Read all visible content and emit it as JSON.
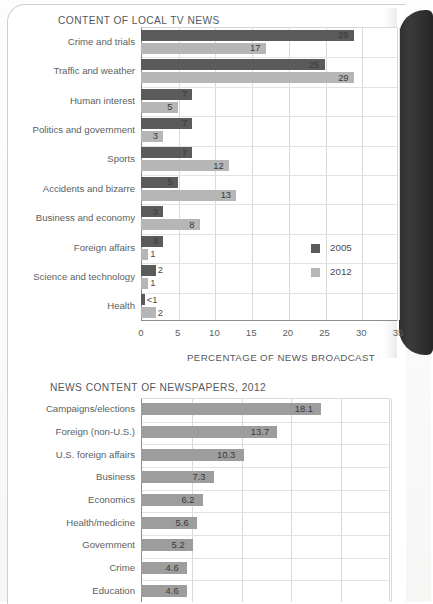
{
  "page": {
    "background_color": "#ffffff",
    "spine_color": "#2f2f2f"
  },
  "chart_data": [
    {
      "type": "bar",
      "orientation": "horizontal",
      "title": "CONTENT OF LOCAL TV NEWS",
      "xlabel": "PERCENTAGE OF NEWS BROADCAST",
      "ylabel": "",
      "xlim": [
        0,
        35
      ],
      "xticks": [
        0,
        5,
        10,
        15,
        20,
        25,
        30,
        35
      ],
      "grid": true,
      "legend_position": "inside-right",
      "categories": [
        "Crime and trials",
        "Traffic and weather",
        "Human interest",
        "Politics and government",
        "Sports",
        "Accidents and bizarre",
        "Business and economy",
        "Foreign affairs",
        "Science and technology",
        "Health"
      ],
      "series": [
        {
          "name": "2005",
          "color": "#5b5b5b",
          "values": [
            29,
            25,
            7,
            7,
            7,
            5,
            3,
            3,
            2,
            0.5
          ],
          "labels": [
            "29",
            "25",
            "7",
            "7",
            "7",
            "5",
            "3",
            "3",
            "2",
            "<1"
          ]
        },
        {
          "name": "2012",
          "color": "#b6b6b6",
          "values": [
            17,
            29,
            5,
            3,
            12,
            13,
            8,
            1,
            1,
            2
          ],
          "labels": [
            "17",
            "29",
            "5",
            "3",
            "12",
            "13",
            "8",
            "1",
            "1",
            "2"
          ]
        }
      ]
    },
    {
      "type": "bar",
      "orientation": "horizontal",
      "title": "NEWS CONTENT OF NEWSPAPERS, 2012",
      "xlabel": "",
      "ylabel": "",
      "xlim": [
        0,
        25
      ],
      "xticks": [
        0,
        5,
        10,
        15,
        20,
        25
      ],
      "grid": true,
      "categories": [
        "Campaigns/elections",
        "Foreign (non-U.S.)",
        "U.S. foreign affairs",
        "Business",
        "Economics",
        "Health/medicine",
        "Government",
        "Crime",
        "Education"
      ],
      "series": [
        {
          "name": "2012",
          "color": "#9d9d9d",
          "values": [
            18.1,
            13.7,
            10.3,
            7.3,
            6.2,
            5.6,
            5.2,
            4.6,
            4.6
          ],
          "labels": [
            "18.1",
            "13.7",
            "10.3",
            "7.3",
            "6.2",
            "5.6",
            "5.2",
            "4.6",
            "4.6"
          ]
        }
      ]
    }
  ]
}
